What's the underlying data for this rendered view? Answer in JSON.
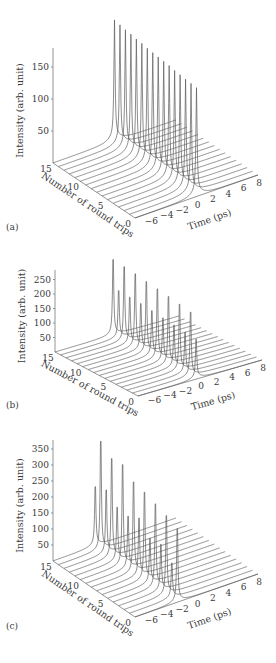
{
  "figure": {
    "line_color": "#5a5a5a",
    "axis_color": "#7a7a7a",
    "background": "#ffffff"
  },
  "chart_data": [
    {
      "panel_label": "(a)",
      "type": "waterfall-3d-line",
      "title": "",
      "zlabel": "Intensity (arb. unit)",
      "xlabel": "Time (ps)",
      "ylabel": "Number of round trips",
      "z_ticks": [
        50,
        100,
        150
      ],
      "x_ticks": [
        "-6",
        "-4",
        "-2",
        "0",
        "2",
        "4",
        "6",
        "8"
      ],
      "y_ticks": [
        "0",
        "5",
        "10",
        "15"
      ],
      "x_range": [
        -8,
        8
      ],
      "y_range": [
        0,
        15
      ],
      "round_trips": [
        15,
        14,
        13,
        12,
        11,
        10,
        9,
        8,
        7,
        6,
        5,
        4,
        3,
        2,
        1,
        0
      ],
      "peak_time_ps": 0,
      "peak_intensity": [
        180,
        178,
        176,
        175,
        173,
        172,
        170,
        169,
        168,
        167,
        166,
        164,
        163,
        162,
        161,
        160
      ],
      "geometry": {
        "origin_back": [
          53,
          163
        ],
        "origin_front": [
          135,
          218
        ],
        "front_right": [
          258,
          175
        ],
        "z_px_per_unit": 0.64,
        "z_axis_top": 48
      }
    },
    {
      "panel_label": "(b)",
      "type": "waterfall-3d-line",
      "title": "",
      "zlabel": "Intensity (arb. unit)",
      "xlabel": "Time (ps)",
      "ylabel": "Number of round trips",
      "z_ticks": [
        50,
        100,
        150,
        200,
        250
      ],
      "x_ticks": [
        "-6",
        "-4",
        "-2",
        "0",
        "2",
        "4",
        "6",
        "8"
      ],
      "y_ticks": [
        "0",
        "5",
        "10",
        "15"
      ],
      "x_range": [
        -8,
        8
      ],
      "y_range": [
        0,
        15
      ],
      "round_trips": [
        15,
        14,
        13,
        12,
        11,
        10,
        9,
        8,
        7,
        6,
        5,
        4,
        3,
        2,
        1,
        0
      ],
      "peak_time_ps": -0.5,
      "peak_intensity": [
        285,
        175,
        280,
        172,
        275,
        170,
        268,
        165,
        262,
        160,
        255,
        155,
        248,
        150,
        240,
        145
      ],
      "geometry": {
        "origin_back": [
          55,
          352
        ],
        "origin_front": [
          138,
          396
        ],
        "front_right": [
          262,
          360
        ],
        "z_px_per_unit": 0.29,
        "z_axis_top": 270
      }
    },
    {
      "panel_label": "(c)",
      "type": "waterfall-3d-line",
      "title": "",
      "zlabel": "Intensity (arb. unit)",
      "xlabel": "Time (ps)",
      "ylabel": "Number of round trips",
      "z_ticks": [
        50,
        100,
        150,
        200,
        250,
        300,
        350
      ],
      "x_ticks": [
        "-6",
        "-4",
        "-2",
        "0",
        "2",
        "4",
        "6",
        "8"
      ],
      "y_ticks": [
        "0",
        "5",
        "10",
        "15"
      ],
      "x_range": [
        -8,
        8
      ],
      "y_range": [
        0,
        15
      ],
      "round_trips": [
        15,
        14,
        13,
        12,
        11,
        10,
        9,
        8,
        7,
        6,
        5,
        4,
        3,
        2,
        1,
        0
      ],
      "peak_time_ps": -2.5,
      "peak_intensity": [
        200,
        375,
        215,
        340,
        180,
        345,
        175,
        310,
        195,
        300,
        150,
        285,
        155,
        270,
        115,
        250
      ],
      "geometry": {
        "origin_back": [
          53,
          561
        ],
        "origin_front": [
          135,
          617
        ],
        "front_right": [
          258,
          574
        ],
        "z_px_per_unit": 0.32,
        "z_axis_top": 440
      }
    }
  ]
}
